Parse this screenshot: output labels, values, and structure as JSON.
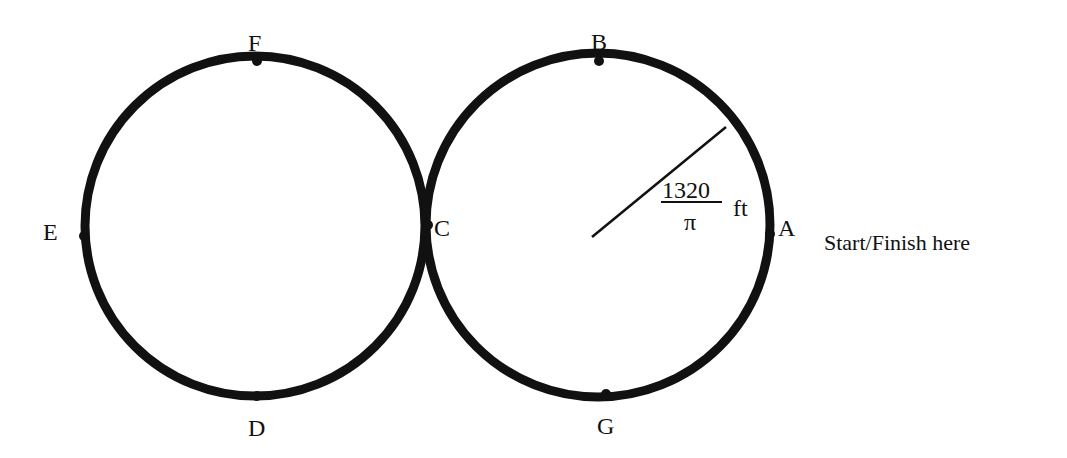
{
  "diagram": {
    "colors": {
      "stroke": "#111111",
      "background": "#ffffff"
    },
    "circles": [
      {
        "name": "left-circle",
        "cx": 255,
        "cy": 226,
        "r": 170
      },
      {
        "name": "right-circle",
        "cx": 598,
        "cy": 225,
        "r": 172
      }
    ],
    "points": [
      {
        "label": "A",
        "x": 770,
        "y": 234,
        "lx": 778,
        "ly": 236
      },
      {
        "label": "B",
        "x": 599,
        "y": 61,
        "lx": 591,
        "ly": 50
      },
      {
        "label": "C",
        "x": 428,
        "y": 225,
        "lx": 434,
        "ly": 236
      },
      {
        "label": "D",
        "x": 257,
        "y": 396,
        "lx": 248,
        "ly": 436
      },
      {
        "label": "E",
        "x": 84,
        "y": 236,
        "lx": 43,
        "ly": 240
      },
      {
        "label": "F",
        "x": 257,
        "y": 61,
        "lx": 248,
        "ly": 51
      },
      {
        "label": "G",
        "x": 606,
        "y": 394,
        "lx": 597,
        "ly": 434
      }
    ],
    "radius_line": {
      "x1": 592,
      "y1": 237,
      "x2": 726,
      "y2": 127
    },
    "radius_label": {
      "numerator": "1320",
      "denominator": "π",
      "unit": "ft"
    },
    "caption": "Start/Finish here"
  }
}
